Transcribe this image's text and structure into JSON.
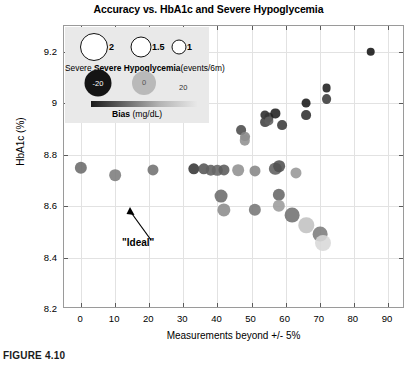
{
  "figure": {
    "caption": "FIGURE 4.10"
  },
  "chart_data": {
    "type": "scatter",
    "title": "Accuracy vs. HbA1c and Severe Hypoglycemia",
    "xlabel": "Measurements beyond +/- 5%",
    "ylabel": "HbA1c (%)",
    "xlim": [
      -5,
      95
    ],
    "ylim": [
      8.2,
      9.3
    ],
    "xticks": [
      0,
      10,
      20,
      30,
      40,
      50,
      60,
      70,
      80,
      90
    ],
    "xtick_labels": [
      "0",
      "10",
      "20",
      "30",
      "40",
      "50",
      "60",
      "70",
      "80",
      "90"
    ],
    "yticks": [
      8.2,
      8.4,
      8.6,
      8.8,
      9.0,
      9.2
    ],
    "ytick_labels": [
      "8.2",
      "8.4",
      "8.6",
      "8.8",
      "9",
      "9.2"
    ],
    "grid": true,
    "legend_position": "upper-left-inset",
    "size_encoding": {
      "label": "Severe Hypoglycemia",
      "units": "(events/6m)",
      "values": [
        2,
        1.5,
        1
      ],
      "value_labels": [
        "2",
        "1.5",
        "1"
      ]
    },
    "color_encoding": {
      "label": "Bias",
      "units": "(mg/dL)",
      "min": -20,
      "mid": 0,
      "max": 20,
      "min_label": "-20",
      "mid_label": "0",
      "max_label": "20",
      "colormap": "gray-dark-to-light"
    },
    "annotations": [
      {
        "text": "\"Ideal\"",
        "x": 0,
        "y": 8.75,
        "arrow": true
      }
    ],
    "points": [
      {
        "x": 0,
        "y": 8.75,
        "size": 1.5,
        "bias": -4
      },
      {
        "x": 10,
        "y": 8.72,
        "size": 1.4,
        "bias": -1
      },
      {
        "x": 21,
        "y": 8.74,
        "size": 1.3,
        "bias": -3
      },
      {
        "x": 33,
        "y": 8.745,
        "size": 1.35,
        "bias": -14
      },
      {
        "x": 36,
        "y": 8.745,
        "size": 1.35,
        "bias": -8
      },
      {
        "x": 38,
        "y": 8.74,
        "size": 1.2,
        "bias": -6
      },
      {
        "x": 40,
        "y": 8.74,
        "size": 1.2,
        "bias": -5
      },
      {
        "x": 42,
        "y": 8.74,
        "size": 1.3,
        "bias": -7
      },
      {
        "x": 46,
        "y": 8.74,
        "size": 1.4,
        "bias": 3
      },
      {
        "x": 41,
        "y": 8.64,
        "size": 1.6,
        "bias": -4
      },
      {
        "x": 42,
        "y": 8.585,
        "size": 1.65,
        "bias": 2
      },
      {
        "x": 51,
        "y": 8.735,
        "size": 1.3,
        "bias": 1
      },
      {
        "x": 57,
        "y": 8.745,
        "size": 1.5,
        "bias": -6
      },
      {
        "x": 58,
        "y": 8.755,
        "size": 1.4,
        "bias": -9
      },
      {
        "x": 63,
        "y": 8.73,
        "size": 1.3,
        "bias": 4
      },
      {
        "x": 51,
        "y": 8.585,
        "size": 1.5,
        "bias": -2
      },
      {
        "x": 58,
        "y": 8.645,
        "size": 1.5,
        "bias": -5
      },
      {
        "x": 58,
        "y": 8.6,
        "size": 1.5,
        "bias": 5
      },
      {
        "x": 62,
        "y": 8.565,
        "size": 1.9,
        "bias": -3
      },
      {
        "x": 66,
        "y": 8.525,
        "size": 2.0,
        "bias": 12
      },
      {
        "x": 70,
        "y": 8.49,
        "size": 1.9,
        "bias": -1
      },
      {
        "x": 71,
        "y": 8.455,
        "size": 2.1,
        "bias": 16
      },
      {
        "x": 47,
        "y": 8.895,
        "size": 1.1,
        "bias": -10
      },
      {
        "x": 48,
        "y": 8.87,
        "size": 1.1,
        "bias": 1
      },
      {
        "x": 48,
        "y": 8.855,
        "size": 1.2,
        "bias": 3
      },
      {
        "x": 54,
        "y": 8.955,
        "size": 1.0,
        "bias": -16
      },
      {
        "x": 55,
        "y": 8.945,
        "size": 1.0,
        "bias": -14
      },
      {
        "x": 54,
        "y": 8.925,
        "size": 1.1,
        "bias": -12
      },
      {
        "x": 55,
        "y": 8.93,
        "size": 1.0,
        "bias": -6
      },
      {
        "x": 57,
        "y": 8.96,
        "size": 1.0,
        "bias": -18
      },
      {
        "x": 59,
        "y": 8.915,
        "size": 1.1,
        "bias": -13
      },
      {
        "x": 66,
        "y": 9.0,
        "size": 0.95,
        "bias": -19
      },
      {
        "x": 66,
        "y": 8.955,
        "size": 1.1,
        "bias": -15
      },
      {
        "x": 72,
        "y": 9.06,
        "size": 0.95,
        "bias": -18
      },
      {
        "x": 72,
        "y": 9.015,
        "size": 1.1,
        "bias": -13
      },
      {
        "x": 85,
        "y": 9.2,
        "size": 0.9,
        "bias": -20
      }
    ]
  }
}
